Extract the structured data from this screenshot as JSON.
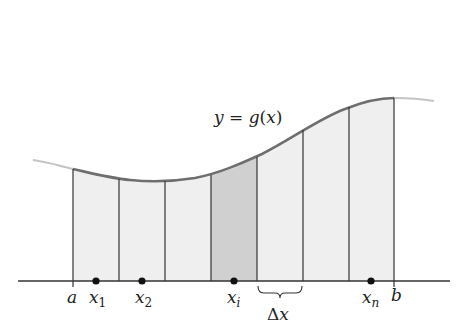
{
  "diagram": {
    "curve_label": "y = g(x)",
    "curve_label_parts": {
      "y": "y",
      "eq": " = ",
      "g": "g",
      "open": "(",
      "x": "x",
      "close": ")"
    },
    "axis_labels": {
      "a": "a",
      "b": "b",
      "x1": {
        "base": "x",
        "sub": "1"
      },
      "x2": {
        "base": "x",
        "sub": "2"
      },
      "xi": {
        "base": "x",
        "sub": "i"
      },
      "xn": {
        "base": "x",
        "sub": "n"
      },
      "delta_x": {
        "delta": "Δ",
        "x": "x"
      }
    },
    "num_subintervals": 7,
    "highlighted_subinterval": 4,
    "colors": {
      "curve": "#6e6e6e",
      "curve_extension": "#c4c4c4",
      "rect_fill": "#efefef",
      "highlight_fill": "#d0d0d0",
      "lines": "#333333",
      "points": "#111111"
    }
  }
}
